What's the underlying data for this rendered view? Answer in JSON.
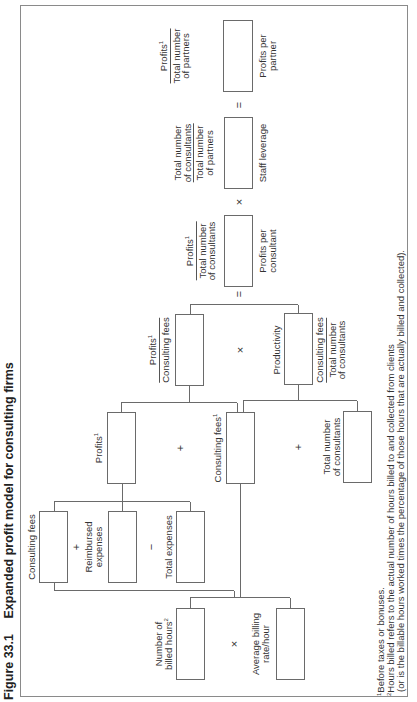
{
  "figure": {
    "number": "Figure 33.1",
    "title": "Expanded profit model for consulting firms"
  },
  "operators": {
    "plus": "+",
    "minus": "−",
    "times": "×",
    "equals": "="
  },
  "nodes": {
    "profits_per_partner": {
      "numerator": "Profits",
      "numerator_sup": "1",
      "denominator_line1": "Total number",
      "denominator_line2": "of partners",
      "caption_line1": "Profits per",
      "caption_line2": "partner"
    },
    "staff_leverage": {
      "numerator_line1": "Total number",
      "numerator_line2": "of consultants",
      "denominator_line1": "Total number",
      "denominator_line2": "of partners",
      "caption": "Staff leverage"
    },
    "profits_per_consultant": {
      "numerator": "Profits",
      "numerator_sup": "1",
      "denominator_line1": "Total number",
      "denominator_line2": "of consultants",
      "caption_line1": "Profits per",
      "caption_line2": "consultant"
    },
    "margin": {
      "numerator": "Profits",
      "numerator_sup": "1",
      "denominator": "Consulting fees"
    },
    "productivity": {
      "label": "Productivity",
      "numerator": "Consulting fees",
      "denominator_line1": "Total number",
      "denominator_line2": "of consultants"
    },
    "profits": {
      "label": "Profits",
      "sup": "1"
    },
    "consulting_fees_calc": {
      "label": "Consulting fees",
      "sup": "1"
    },
    "total_consultants": {
      "line1": "Total number",
      "line2": "of consultants"
    },
    "consulting_fees": {
      "label": "Consulting fees"
    },
    "reimbursed_expenses": {
      "line1": "Reimbursed",
      "line2": "expenses"
    },
    "total_expenses": {
      "label": "Total expenses"
    },
    "billed_hours": {
      "line1": "Number of",
      "line2": "billed hours",
      "sup": "2"
    },
    "billing_rate": {
      "line1": "Average billing",
      "line2": "rate/hour"
    }
  },
  "footnotes": {
    "fn1_mark": "1",
    "fn1": "Before taxes or bonuses.",
    "fn2_mark": "2",
    "fn2": "Hours billed refers to the actual number of hours billed to and collected from clients",
    "fn2_cont": "(or is the billable hours worked times the percentage of those hours that are actually billed and collected)."
  }
}
